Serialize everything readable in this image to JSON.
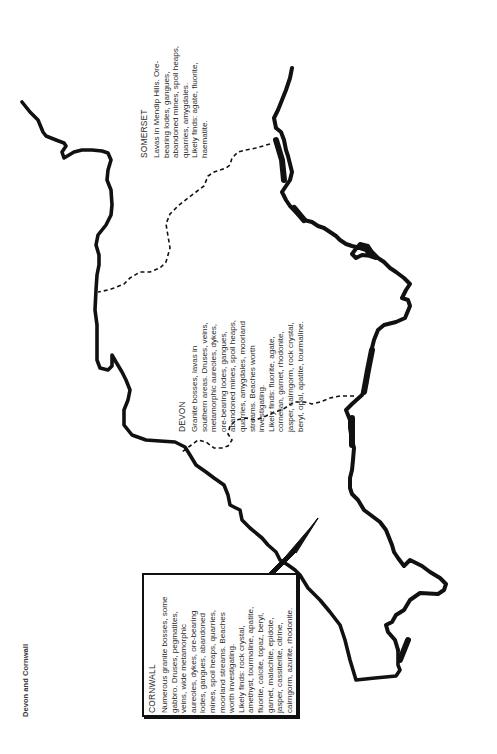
{
  "page": {
    "caption": "Devon and Cornwall"
  },
  "regions": {
    "somerset": {
      "title": "SOMERSET",
      "lines": [
        "Lavas in Mendip Hills. Ore-",
        "bearing lodes, gangues,",
        "abandoned mines, spoil heaps,",
        "quarries, amygdales.",
        "Likely finds: agate, fluorite,",
        "haematite."
      ]
    },
    "devon": {
      "title": "DEVON",
      "lines": [
        "Granite bosses, lavas in",
        "southern areas. Druses, veins,",
        "metamorphic aureoles, dykes,",
        "ore-bearing lodes, gangues,",
        "abandoned mines, spoil heaps,",
        "quarries, amygdales, moorland",
        "streams. Beaches worth",
        "investigating.",
        "Likely finds: fluorite, agate,",
        "cornelian, garnet, rhodonite,",
        "jasper, cairngorm, rock crystal,",
        "beryl, opal, apatite, tourmaline."
      ]
    },
    "cornwall": {
      "title": "CORNWALL",
      "lines": [
        "Numerous granite bosses, some",
        "gabbro. Druses, pegmatites,",
        "veins, wide metamorphic",
        "aureoles, dykes, ore-bearing",
        "lodes, gangues, abandoned",
        "mines, spoil heaps, quarries,",
        "moorland streams. Beaches",
        "worth investigating.",
        "Likely finds: rock crystal,",
        "amethyst, tourmaline, apatite,",
        "fluorite, calcite, topaz, beryl,",
        "garnet, malachite, epidote,",
        "jasper, cassiterite, citrine,",
        "cairngorm, azurite, rhodonite."
      ]
    }
  },
  "colors": {
    "coastline": "#111111",
    "text": "#2a2a2a",
    "background": "#ffffff"
  }
}
